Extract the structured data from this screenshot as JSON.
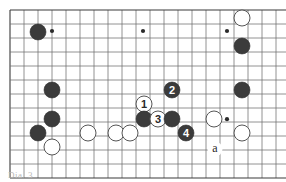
{
  "diagram": {
    "type": "go-board-diagram",
    "caption": "Dia. 3",
    "board": {
      "origin_x": 10,
      "origin_y": 10,
      "spacing": 14,
      "cols": 20,
      "rows": 12,
      "line_color": "#6d6d6d",
      "edge_color": "#3a3a3a",
      "background": "#ffffff"
    },
    "star_points": [
      {
        "col": 3,
        "row": 1.5
      },
      {
        "col": 9.5,
        "row": 1.5
      },
      {
        "col": 15.5,
        "row": 1.5
      },
      {
        "col": 15.5,
        "row": 7.8
      }
    ],
    "stones": [
      {
        "color": "black",
        "x": 38,
        "y": 32,
        "label": ""
      },
      {
        "color": "white",
        "x": 242,
        "y": 18,
        "label": ""
      },
      {
        "color": "black",
        "x": 242,
        "y": 46,
        "label": ""
      },
      {
        "color": "black",
        "x": 52,
        "y": 90,
        "label": ""
      },
      {
        "color": "black",
        "x": 242,
        "y": 90,
        "label": ""
      },
      {
        "color": "black",
        "x": 52,
        "y": 119,
        "label": ""
      },
      {
        "color": "black",
        "x": 38,
        "y": 133,
        "label": ""
      },
      {
        "color": "white",
        "x": 88,
        "y": 133,
        "label": ""
      },
      {
        "color": "white",
        "x": 52,
        "y": 147,
        "label": ""
      },
      {
        "color": "white",
        "x": 116,
        "y": 133,
        "label": ""
      },
      {
        "color": "white",
        "x": 130,
        "y": 133,
        "label": ""
      },
      {
        "color": "white",
        "x": 144,
        "y": 104,
        "label": "1"
      },
      {
        "color": "black",
        "x": 144,
        "y": 119,
        "label": ""
      },
      {
        "color": "black",
        "x": 172,
        "y": 90,
        "label": "2"
      },
      {
        "color": "white",
        "x": 158,
        "y": 119,
        "label": "3"
      },
      {
        "color": "black",
        "x": 172,
        "y": 119,
        "label": ""
      },
      {
        "color": "black",
        "x": 186,
        "y": 133,
        "label": "4"
      },
      {
        "color": "white",
        "x": 214,
        "y": 119,
        "label": ""
      },
      {
        "color": "white",
        "x": 242,
        "y": 133,
        "label": ""
      }
    ],
    "point_labels": [
      {
        "text": "a",
        "x": 215,
        "y": 152
      }
    ],
    "colors": {
      "black_stone": "#3b3b3b",
      "white_stone_fill": "#ffffff",
      "white_stone_stroke": "#555555",
      "label_on_black": "#ffffff",
      "label_on_white": "#2a2a2a",
      "point_label": "#2a2a2a"
    },
    "stone_radius": 8
  }
}
